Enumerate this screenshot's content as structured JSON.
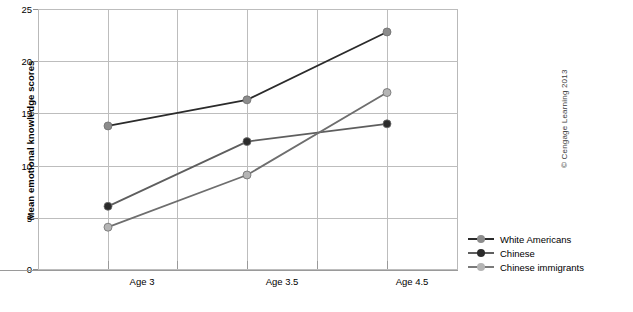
{
  "chart_data": {
    "type": "line",
    "title": "",
    "xlabel": "",
    "ylabel": "Mean emotional knowledge scores",
    "categories": [
      "Age 3",
      "Age 3.5",
      "Age 4.5"
    ],
    "ylim": [
      0,
      25
    ],
    "yticks": [
      0,
      5,
      10,
      15,
      20,
      25
    ],
    "ytick_labels": [
      "0",
      "5",
      "10",
      "15",
      "20",
      "25"
    ],
    "grid": "both",
    "legend_position": "right",
    "series": [
      {
        "name": "White Americans",
        "values": [
          13.8,
          16.3,
          22.8
        ],
        "color": "#2b2b2b",
        "marker_color": "#8c8c8c"
      },
      {
        "name": "Chinese",
        "values": [
          6.1,
          12.3,
          14.0
        ],
        "color": "#5e5e5e",
        "marker_color": "#2b2b2b"
      },
      {
        "name": "Chinese immigrants",
        "values": [
          4.1,
          9.1,
          17.0
        ],
        "color": "#6e6e6e",
        "marker_color": "#b5b5b5"
      }
    ]
  },
  "axis": {
    "y_title": "Mean emotional knowledge scores",
    "tick_labels_y": [
      "25",
      "20",
      "15",
      "10",
      "5",
      "0"
    ],
    "tick_labels_x": [
      "Age 3",
      "Age 3.5",
      "Age 4.5"
    ]
  },
  "legend": {
    "items": [
      {
        "label": "White Americans",
        "line_color": "#2b2b2b",
        "dot_color": "#8c8c8c"
      },
      {
        "label": "Chinese",
        "line_color": "#5e5e5e",
        "dot_color": "#2b2b2b"
      },
      {
        "label": "Chinese immigrants",
        "line_color": "#7a7a7a",
        "dot_color": "#b5b5b5"
      }
    ]
  },
  "credit": {
    "text": "© Cengage Learning 2013"
  },
  "colors": {
    "grid": "#bdbdbd",
    "axis": "#9a9a9a",
    "background": "#ffffff",
    "text": "#000000"
  }
}
